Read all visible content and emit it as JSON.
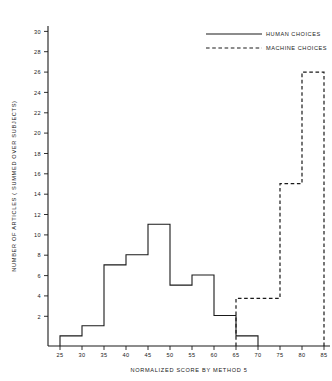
{
  "chart_data": {
    "type": "line",
    "title": "",
    "xlabel": "NORMALIZED SCORE BY METHOD 5",
    "ylabel": "NUMBER OF ARTICLES ( SUMMED OVER SUBJECTS)",
    "xlim": [
      20,
      87
    ],
    "ylim": [
      0,
      31
    ],
    "xticks": [
      25,
      30,
      35,
      40,
      45,
      50,
      55,
      60,
      65,
      70,
      75,
      80,
      85
    ],
    "yticks": [
      2,
      4,
      6,
      8,
      10,
      12,
      14,
      16,
      18,
      20,
      22,
      24,
      26,
      28,
      30
    ],
    "grid": false,
    "legend_position": "top-right",
    "bin_width": 5,
    "series": [
      {
        "name": "HUMAN CHOICES",
        "style": "solid",
        "color": "#1a1a1a",
        "bin_starts": [
          25,
          30,
          35,
          40,
          45,
          50,
          55,
          60,
          65
        ],
        "values": [
          1,
          2,
          8,
          9,
          12,
          6,
          7,
          3,
          1
        ]
      },
      {
        "name": "MACHINE CHOICES",
        "style": "dashed",
        "color": "#1a1a1a",
        "bin_starts": [
          65,
          70,
          75,
          80
        ],
        "values": [
          4.7,
          4.7,
          16,
          27
        ]
      }
    ]
  },
  "legend": {
    "items": [
      {
        "label": "HUMAN CHOICES",
        "style": "solid"
      },
      {
        "label": "MACHINE CHOICES",
        "style": "dashed"
      }
    ]
  },
  "axes": {
    "x_title": "NORMALIZED SCORE BY METHOD 5",
    "y_title": "NUMBER OF ARTICLES ( SUMMED OVER SUBJECTS)",
    "x_tick_labels": [
      "25",
      "30",
      "35",
      "40",
      "45",
      "50",
      "55",
      "60",
      "65",
      "70",
      "75",
      "80",
      "85"
    ],
    "y_tick_labels": [
      "2",
      "4",
      "6",
      "8",
      "10",
      "12",
      "14",
      "16",
      "18",
      "20",
      "22",
      "24",
      "26",
      "28",
      "30"
    ]
  }
}
